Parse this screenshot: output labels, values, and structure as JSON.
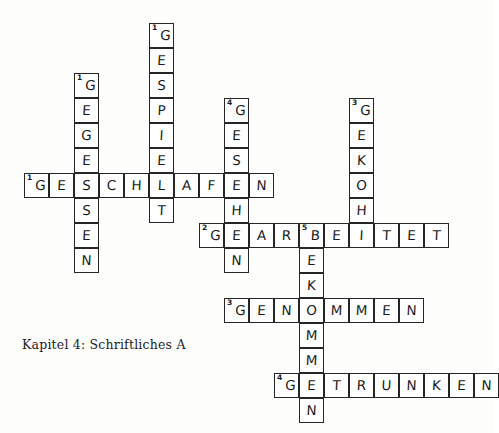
{
  "document": {
    "caption": "Kapitel 4: Schriftliches A",
    "type": "crossword-puzzle-worksheet",
    "language": "German"
  },
  "grid": {
    "cell_size": 25,
    "origin_x": 24,
    "origin_y": 23,
    "ink_color": "#262626",
    "cell_fill": "#ffffff"
  },
  "entries": {
    "across": [
      {
        "number": "1",
        "answer": "GESCHLAFEN",
        "row": 6,
        "col": 0,
        "letters": [
          "G",
          "E",
          "S",
          "C",
          "H",
          "L",
          "A",
          "F",
          "E",
          "N"
        ]
      },
      {
        "number": "2",
        "answer": "GEARBEITET",
        "row": 8,
        "col": 7,
        "letters": [
          "G",
          "E",
          "A",
          "R",
          "B",
          "E",
          "I",
          "T",
          "E",
          "T"
        ]
      },
      {
        "number": "3",
        "answer": "GENOMMEN",
        "row": 11,
        "col": 8,
        "letters": [
          "G",
          "E",
          "N",
          "O",
          "M",
          "M",
          "E",
          "N"
        ]
      },
      {
        "number": "4",
        "answer": "GETRUNKEN",
        "row": 14,
        "col": 10,
        "letters": [
          "G",
          "E",
          "T",
          "R",
          "U",
          "N",
          "K",
          "E",
          "N"
        ]
      }
    ],
    "down": [
      {
        "number": "1",
        "answer": "GESPIELT",
        "row": 0,
        "col": 5,
        "letters": [
          "G",
          "E",
          "S",
          "P",
          "I",
          "E",
          "L",
          "T"
        ]
      },
      {
        "number": "1",
        "answer": "GEGESSEN",
        "row": 2,
        "col": 2,
        "letters": [
          "G",
          "E",
          "G",
          "E",
          "S",
          "S",
          "E",
          "N"
        ]
      },
      {
        "number": "3",
        "answer": "GEKOCHT",
        "row": 3,
        "col": 13,
        "letters": [
          "G",
          "E",
          "K",
          "O",
          "H",
          "C",
          "T"
        ]
      },
      {
        "number": "4",
        "answer": "GESEHEN",
        "row": 3,
        "col": 8,
        "letters": [
          "G",
          "E",
          "S",
          "E",
          "H",
          "E",
          "N"
        ]
      },
      {
        "number": "5",
        "answer": "BEKOMMEN",
        "row": 8,
        "col": 10,
        "letters": [
          "B",
          "E",
          "K",
          "O",
          "M",
          "M",
          "E",
          "N"
        ]
      }
    ]
  },
  "cells": [
    {
      "r": 0,
      "c": 5,
      "l": "G",
      "n": "1"
    },
    {
      "r": 1,
      "c": 5,
      "l": "E",
      "n": ""
    },
    {
      "r": 2,
      "c": 2,
      "l": "G",
      "n": "1"
    },
    {
      "r": 2,
      "c": 5,
      "l": "S",
      "n": ""
    },
    {
      "r": 3,
      "c": 2,
      "l": "E",
      "n": ""
    },
    {
      "r": 3,
      "c": 5,
      "l": "P",
      "n": ""
    },
    {
      "r": 3,
      "c": 8,
      "l": "G",
      "n": "4"
    },
    {
      "r": 3,
      "c": 13,
      "l": "G",
      "n": "3"
    },
    {
      "r": 4,
      "c": 2,
      "l": "G",
      "n": ""
    },
    {
      "r": 4,
      "c": 5,
      "l": "I",
      "n": ""
    },
    {
      "r": 4,
      "c": 8,
      "l": "E",
      "n": ""
    },
    {
      "r": 4,
      "c": 13,
      "l": "E",
      "n": ""
    },
    {
      "r": 5,
      "c": 2,
      "l": "E",
      "n": ""
    },
    {
      "r": 5,
      "c": 5,
      "l": "E",
      "n": ""
    },
    {
      "r": 5,
      "c": 8,
      "l": "S",
      "n": ""
    },
    {
      "r": 5,
      "c": 13,
      "l": "K",
      "n": ""
    },
    {
      "r": 6,
      "c": 0,
      "l": "G",
      "n": "1"
    },
    {
      "r": 6,
      "c": 1,
      "l": "E",
      "n": ""
    },
    {
      "r": 6,
      "c": 2,
      "l": "S",
      "n": ""
    },
    {
      "r": 6,
      "c": 3,
      "l": "C",
      "n": ""
    },
    {
      "r": 6,
      "c": 4,
      "l": "H",
      "n": ""
    },
    {
      "r": 6,
      "c": 5,
      "l": "L",
      "n": ""
    },
    {
      "r": 6,
      "c": 6,
      "l": "A",
      "n": ""
    },
    {
      "r": 6,
      "c": 7,
      "l": "F",
      "n": ""
    },
    {
      "r": 6,
      "c": 8,
      "l": "E",
      "n": ""
    },
    {
      "r": 6,
      "c": 9,
      "l": "N",
      "n": ""
    },
    {
      "r": 6,
      "c": 13,
      "l": "O",
      "n": ""
    },
    {
      "r": 7,
      "c": 2,
      "l": "S",
      "n": ""
    },
    {
      "r": 7,
      "c": 5,
      "l": "T",
      "n": ""
    },
    {
      "r": 7,
      "c": 8,
      "l": "H",
      "n": ""
    },
    {
      "r": 7,
      "c": 13,
      "l": "H",
      "n": ""
    },
    {
      "r": 8,
      "c": 2,
      "l": "E",
      "n": ""
    },
    {
      "r": 8,
      "c": 7,
      "l": "G",
      "n": "2"
    },
    {
      "r": 8,
      "c": 8,
      "l": "E",
      "n": ""
    },
    {
      "r": 8,
      "c": 9,
      "l": "A",
      "n": ""
    },
    {
      "r": 8,
      "c": 10,
      "l": "R",
      "n": ""
    },
    {
      "r": 8,
      "c": 11,
      "l": "B",
      "n": "5"
    },
    {
      "r": 8,
      "c": 12,
      "l": "E",
      "n": ""
    },
    {
      "r": 8,
      "c": 13,
      "l": "I",
      "n": ""
    },
    {
      "r": 8,
      "c": 14,
      "l": "T",
      "n": ""
    },
    {
      "r": 8,
      "c": 15,
      "l": "E",
      "n": ""
    },
    {
      "r": 8,
      "c": 16,
      "l": "T",
      "n": ""
    },
    {
      "r": 9,
      "c": 2,
      "l": "N",
      "n": ""
    },
    {
      "r": 9,
      "c": 8,
      "l": "N",
      "n": ""
    },
    {
      "r": 9,
      "c": 11,
      "l": "E",
      "n": ""
    },
    {
      "r": 10,
      "c": 11,
      "l": "K",
      "n": ""
    },
    {
      "r": 11,
      "c": 8,
      "l": "G",
      "n": "3"
    },
    {
      "r": 11,
      "c": 9,
      "l": "E",
      "n": ""
    },
    {
      "r": 11,
      "c": 10,
      "l": "N",
      "n": ""
    },
    {
      "r": 11,
      "c": 11,
      "l": "O",
      "n": ""
    },
    {
      "r": 11,
      "c": 12,
      "l": "M",
      "n": ""
    },
    {
      "r": 11,
      "c": 13,
      "l": "M",
      "n": ""
    },
    {
      "r": 11,
      "c": 14,
      "l": "E",
      "n": ""
    },
    {
      "r": 11,
      "c": 15,
      "l": "N",
      "n": ""
    },
    {
      "r": 12,
      "c": 11,
      "l": "M",
      "n": ""
    },
    {
      "r": 13,
      "c": 11,
      "l": "M",
      "n": ""
    },
    {
      "r": 14,
      "c": 10,
      "l": "G",
      "n": "4"
    },
    {
      "r": 14,
      "c": 11,
      "l": "E",
      "n": ""
    },
    {
      "r": 14,
      "c": 12,
      "l": "T",
      "n": ""
    },
    {
      "r": 14,
      "c": 13,
      "l": "R",
      "n": ""
    },
    {
      "r": 14,
      "c": 14,
      "l": "U",
      "n": ""
    },
    {
      "r": 14,
      "c": 15,
      "l": "N",
      "n": ""
    },
    {
      "r": 14,
      "c": 16,
      "l": "K",
      "n": ""
    },
    {
      "r": 14,
      "c": 17,
      "l": "E",
      "n": ""
    },
    {
      "r": 14,
      "c": 18,
      "l": "N",
      "n": ""
    },
    {
      "r": 15,
      "c": 11,
      "l": "N",
      "n": ""
    }
  ]
}
